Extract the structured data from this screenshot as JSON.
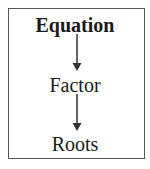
{
  "diagram": {
    "type": "flowchart",
    "direction": "top-to-bottom",
    "nodes": [
      {
        "id": "equation",
        "label": "Equation",
        "bold": true
      },
      {
        "id": "factor",
        "label": "Factor",
        "bold": false
      },
      {
        "id": "roots",
        "label": "Roots",
        "bold": false
      }
    ],
    "edges": [
      {
        "from": "equation",
        "to": "factor"
      },
      {
        "from": "factor",
        "to": "roots"
      }
    ],
    "colors": {
      "border": "#555555",
      "arrow": "#333333",
      "text": "#1a1a1a"
    }
  }
}
